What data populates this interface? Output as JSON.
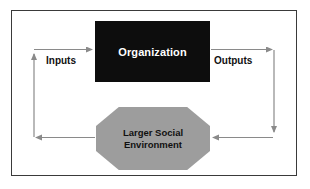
{
  "diagram": {
    "frame": {
      "border_color": "#3a3a3a",
      "background_color": "#ffffff"
    },
    "nodes": [
      {
        "id": "organization",
        "label": "Organization",
        "shape": "rectangle",
        "fill_color": "#0d0d0d",
        "text_color": "#ffffff"
      },
      {
        "id": "larger-social-environment",
        "label": "Larger Social\nEnvironment",
        "label_line_1": "Larger Social",
        "label_line_2": "Environment",
        "shape": "octagon",
        "fill_color": "#9d9d9d",
        "text_color": "#111111"
      }
    ],
    "flow_labels": {
      "inputs": "Inputs",
      "outputs": "Outputs"
    },
    "arrows": {
      "color": "#8a8a8a",
      "items": [
        {
          "id": "inputs-arrow",
          "from": "left-channel",
          "to": "organization",
          "direction": "right"
        },
        {
          "id": "outputs-arrow",
          "from": "organization",
          "to": "right-channel",
          "direction": "right"
        },
        {
          "id": "right-down-arrow",
          "from": "right-channel-top",
          "to": "right-channel-bottom",
          "direction": "down"
        },
        {
          "id": "environment-in-arrow",
          "from": "right-channel",
          "to": "larger-social-environment",
          "direction": "left"
        },
        {
          "id": "environment-out-arrow",
          "from": "larger-social-environment",
          "to": "left-channel",
          "direction": "left"
        },
        {
          "id": "left-up-arrow",
          "from": "left-channel-bottom",
          "to": "left-channel-top",
          "direction": "up"
        }
      ]
    }
  }
}
